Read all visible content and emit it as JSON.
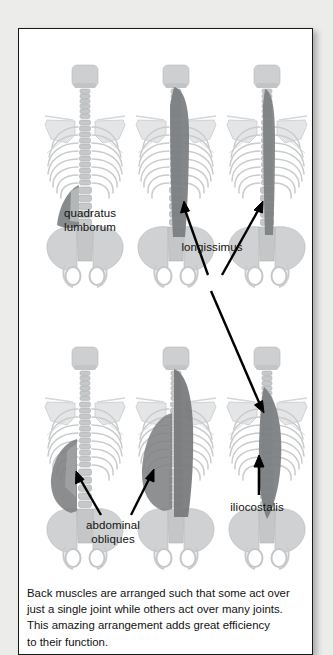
{
  "figure": {
    "panel_name": "back-muscles-figure",
    "background_color": "#ffffff",
    "page_background_color": "#ececeb",
    "border_color": "#1a1a1a",
    "bone_color": "#c9cbcc",
    "muscle_color": "#7b7e80",
    "arrow_color": "#000000",
    "labels": [
      {
        "id": "quadratus",
        "text": "quadratus\nlumborum",
        "lines": [
          "quadratus",
          "lumborum"
        ]
      },
      {
        "id": "longissimus",
        "text": "longissimus",
        "lines": [
          "longissimus"
        ]
      },
      {
        "id": "abdominal",
        "text": "abdominal\nobliques",
        "lines": [
          "abdominal",
          "obliques"
        ]
      },
      {
        "id": "iliocostalis",
        "text": "iliocostalis",
        "lines": [
          "iliocostalis"
        ]
      }
    ],
    "figures": [
      {
        "id": "top-left",
        "row": 1,
        "col": 1,
        "muscle": "quadratus lumborum",
        "highlight": "lower-lumbar-flank"
      },
      {
        "id": "top-center",
        "row": 1,
        "col": 2,
        "muscle": "longissimus",
        "highlight": "full-length-spinal-band"
      },
      {
        "id": "top-right",
        "row": 1,
        "col": 3,
        "muscle": "longissimus",
        "highlight": "narrow-spinal-band"
      },
      {
        "id": "bottom-left",
        "row": 2,
        "col": 1,
        "muscle": "abdominal obliques",
        "highlight": "left-flank-sheet"
      },
      {
        "id": "bottom-center",
        "row": 2,
        "col": 2,
        "muscle": "abdominal obliques",
        "highlight": "broad-torso-sheet"
      },
      {
        "id": "bottom-right",
        "row": 2,
        "col": 3,
        "muscle": "iliocostalis",
        "highlight": "spindle-erector-band"
      }
    ],
    "caption": {
      "line1": "Back muscles are arranged such that some act over",
      "line2": "just a single joint while others act over many joints.",
      "line3": "This amazing arrangement adds great efficiency",
      "line4": "to their function."
    }
  }
}
